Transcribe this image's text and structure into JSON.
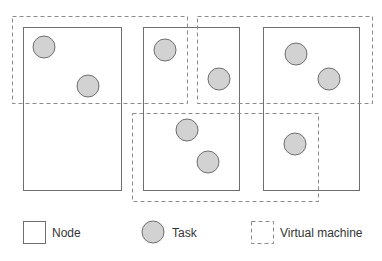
{
  "diagram": {
    "nodes": [
      {
        "id": "node-1",
        "x": 23,
        "y": 27,
        "w": 98,
        "h": 163
      },
      {
        "id": "node-2",
        "x": 143,
        "y": 27,
        "w": 96,
        "h": 163
      },
      {
        "id": "node-3",
        "x": 263,
        "y": 27,
        "w": 96,
        "h": 163
      }
    ],
    "virtual_machines": [
      {
        "id": "vm-1",
        "x": 12,
        "y": 16,
        "w": 175,
        "h": 87
      },
      {
        "id": "vm-2",
        "x": 197,
        "y": 16,
        "w": 175,
        "h": 87
      },
      {
        "id": "vm-3",
        "x": 132,
        "y": 113,
        "w": 186,
        "h": 88
      }
    ],
    "tasks": [
      {
        "cx": 44,
        "cy": 47
      },
      {
        "cx": 88,
        "cy": 86
      },
      {
        "cx": 165,
        "cy": 50
      },
      {
        "cx": 219,
        "cy": 79
      },
      {
        "cx": 296,
        "cy": 54
      },
      {
        "cx": 329,
        "cy": 79
      },
      {
        "cx": 187,
        "cy": 130
      },
      {
        "cx": 208,
        "cy": 162
      },
      {
        "cx": 295,
        "cy": 144
      }
    ],
    "task_radius": 11,
    "colors": {
      "node_stroke": "#6e6e6e",
      "vm_stroke": "#8a8a8a",
      "task_fill": "#d2d2d2"
    }
  },
  "legend": {
    "node_label": "Node",
    "task_label": "Task",
    "vm_label": "Virtual machine"
  }
}
